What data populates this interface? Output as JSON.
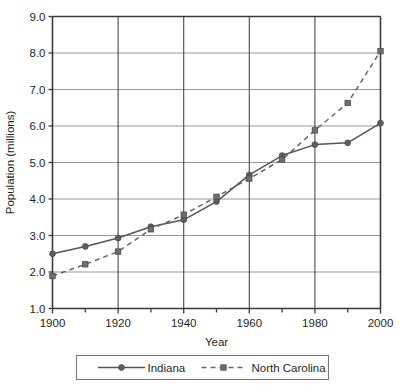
{
  "chart_data": {
    "type": "line",
    "title": "",
    "xlabel": "Year",
    "ylabel": "Population (millions)",
    "x": [
      1900,
      1910,
      1920,
      1930,
      1940,
      1950,
      1960,
      1970,
      1980,
      1990,
      2000
    ],
    "xlim": [
      1900,
      2000
    ],
    "ylim": [
      1.0,
      9.0
    ],
    "xticks": [
      1900,
      1920,
      1940,
      1960,
      1980,
      2000
    ],
    "xtick_labels": [
      "1900",
      "1920",
      "1940",
      "1960",
      "1980",
      "2000"
    ],
    "yticks": [
      1.0,
      2.0,
      3.0,
      4.0,
      5.0,
      6.0,
      7.0,
      8.0,
      9.0
    ],
    "ytick_labels": [
      "1.0",
      "2.0",
      "3.0",
      "4.0",
      "5.0",
      "6.0",
      "7.0",
      "8.0",
      "9.0"
    ],
    "minor_xticks": [
      1910,
      1930,
      1950,
      1970,
      1990
    ],
    "grid": "horizontal-and-vertical",
    "legend_position": "bottom",
    "series": [
      {
        "name": "Indiana",
        "marker": "circle",
        "line_style": "solid",
        "color": "#555555",
        "values": [
          2.5,
          2.7,
          2.93,
          3.24,
          3.43,
          3.93,
          4.66,
          5.19,
          5.49,
          5.54,
          6.08
        ]
      },
      {
        "name": "North Carolina",
        "marker": "square",
        "line_style": "dashed",
        "color": "#666666",
        "values": [
          1.89,
          2.21,
          2.56,
          3.17,
          3.57,
          4.06,
          4.56,
          5.08,
          5.88,
          6.63,
          8.05
        ]
      }
    ]
  },
  "legend": {
    "items": [
      {
        "label": "Indiana"
      },
      {
        "label": "North Carolina"
      }
    ]
  }
}
